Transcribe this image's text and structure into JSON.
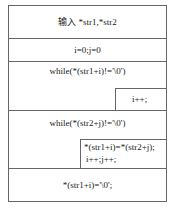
{
  "diagram": {
    "type": "nassi-shneiderman",
    "blocks": {
      "input": "输入 *str1,*str2",
      "init": "i=0;j=0",
      "loop1": {
        "condition": "while(*(str1+i)!='\\0')",
        "body": "i++;"
      },
      "loop2": {
        "condition": "while(*(str2+j)!='\\0')",
        "body_line1": "*(str1+i)=*(str2+j);",
        "body_line2": "i++;j++;"
      },
      "terminate": "*(str1+i)='\\0';"
    }
  }
}
